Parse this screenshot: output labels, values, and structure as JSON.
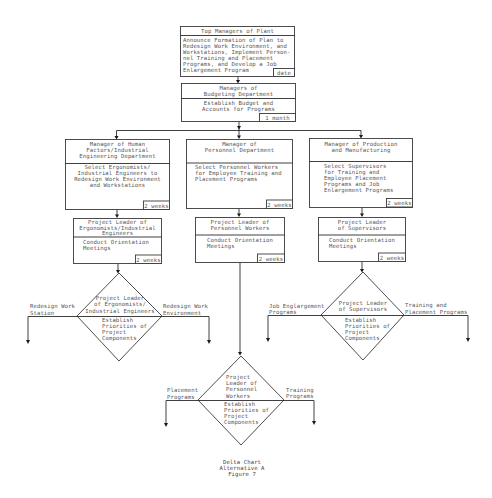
{
  "diagram": {
    "type": "flowchart",
    "style": {
      "line_color": "#2a2a2a",
      "text_color": "#555555",
      "background": "#ffffff"
    },
    "top": {
      "title": "Top Managers of Plant",
      "body": [
        "Announce Formation of Plan to",
        "Redesign Work Environment, and",
        "Workstations, Implement Person-",
        "nel Training and Placement",
        "Programs, and Develop a Job",
        "Enlargement Program"
      ],
      "duration": "date"
    },
    "budget": {
      "title": [
        "Managers of",
        "Budgeting Department"
      ],
      "body": [
        "Establish Budget and",
        "Accounts for Programs"
      ],
      "duration": "1 month"
    },
    "managers": [
      {
        "title": [
          "Manager of Human",
          "Factors/Industrial",
          "Engineering Department"
        ],
        "body": [
          "Select Ergonomists/",
          "Industrial Engineers to",
          "Redesign Work Environment",
          "and Workstations"
        ],
        "duration": "2 weeks"
      },
      {
        "title": [
          "Manager of",
          "Personnel Department"
        ],
        "body": [
          "Select Personnel Workers",
          "for Employee Training and",
          "Placement Programs"
        ],
        "duration": "2 weeks"
      },
      {
        "title": [
          "Manager of Production",
          "and Manufacturing"
        ],
        "body": [
          "Select Supervisors",
          "for Training and",
          "Employee Placement",
          "Programs and Job",
          "Enlargement Programs"
        ],
        "duration": "2 weeks"
      }
    ],
    "leaders": [
      {
        "title": [
          "Project Leader of",
          "Ergonomists/Industrial",
          "Engineers"
        ],
        "body": [
          "Conduct Orientation",
          "Meetings"
        ],
        "duration": "2 weeks"
      },
      {
        "title": [
          "Project Leader of",
          "Personnel Workers"
        ],
        "body": [
          "Conduct Orientation",
          "Meetings"
        ],
        "duration": "2 weeks"
      },
      {
        "title": [
          "Project Leader",
          "of Supervisors"
        ],
        "body": [
          "Conduct Orientation",
          "Meetings"
        ],
        "duration": "2 weeks"
      }
    ],
    "decisions": [
      {
        "top": [
          "Project Leader",
          "of Ergonomists/",
          "Industrial Engineers"
        ],
        "bottom": [
          "Establish",
          "Priorities of",
          "Project",
          "Components"
        ],
        "left_out": [
          "Redesign Work",
          "Station"
        ],
        "right_out": [
          "Redesign Work",
          "Environment"
        ]
      },
      {
        "top": [
          "Project",
          "Leader of",
          "Personnel",
          "Workers"
        ],
        "bottom": [
          "Establish",
          "Priorities of",
          "Project",
          "Components"
        ],
        "left_out": [
          "Placement",
          "Programs"
        ],
        "right_out": [
          "Training",
          "Programs"
        ]
      },
      {
        "top": [
          "Project Leader",
          "of Supervisors"
        ],
        "bottom": [
          "Establish",
          "Priorities of",
          "Project",
          "Components"
        ],
        "left_out": [
          "Job Englargement",
          "Programs"
        ],
        "right_out": [
          "Training and",
          "Placement Programs"
        ]
      }
    ],
    "caption": [
      "Delta Chart",
      "Alternative A",
      "Figure 7"
    ]
  }
}
